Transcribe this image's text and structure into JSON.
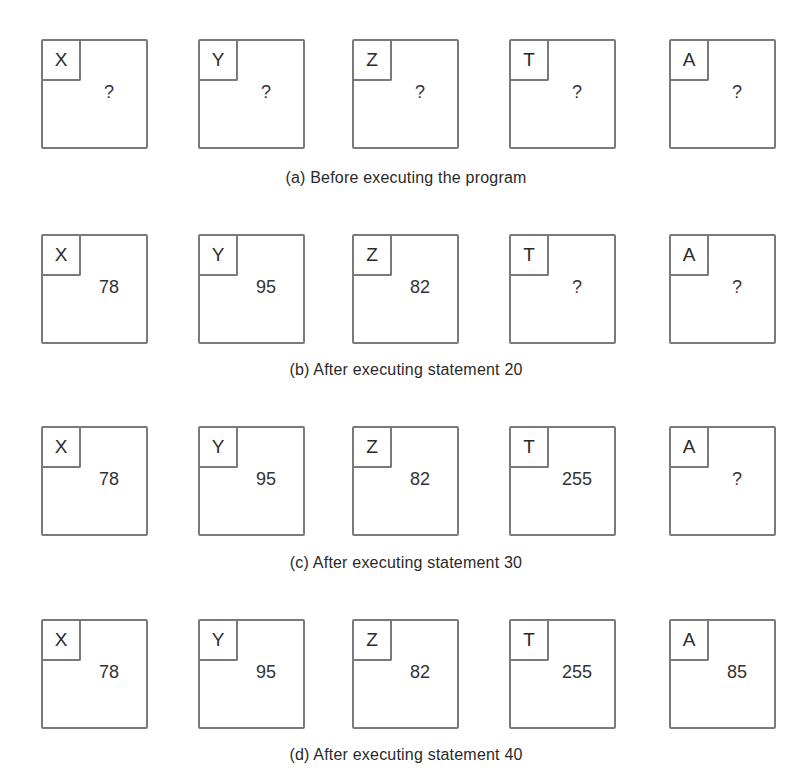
{
  "variables": [
    "X",
    "Y",
    "Z",
    "T",
    "A"
  ],
  "states": [
    {
      "caption": "(a) Before executing the program",
      "values": [
        "?",
        "?",
        "?",
        "?",
        "?"
      ]
    },
    {
      "caption": "(b) After executing statement 20",
      "values": [
        "78",
        "95",
        "82",
        "?",
        "?"
      ]
    },
    {
      "caption": "(c) After executing statement 30",
      "values": [
        "78",
        "95",
        "82",
        "255",
        "?"
      ]
    },
    {
      "caption": "(d) After executing statement 40",
      "values": [
        "78",
        "95",
        "82",
        "255",
        "85"
      ]
    }
  ],
  "colors": {
    "box_border": "#7a7a7a",
    "text": "#2a2a2a",
    "background": "#ffffff"
  }
}
